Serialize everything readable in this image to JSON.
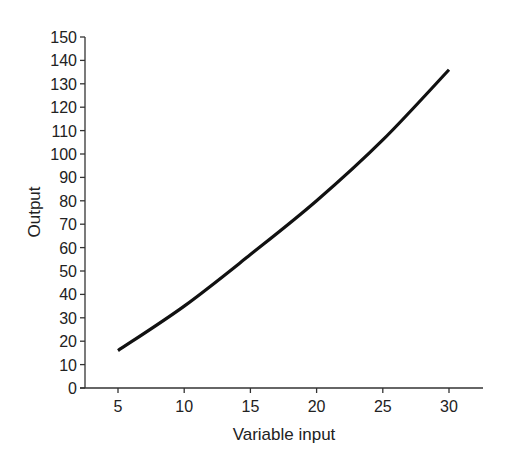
{
  "chart_data": {
    "type": "line",
    "title": "",
    "xlabel": "Variable input",
    "ylabel": "Output",
    "x": [
      5,
      10,
      15,
      20,
      25,
      30
    ],
    "series": [
      {
        "name": "Output",
        "values": [
          16,
          35,
          57,
          80,
          106,
          136
        ],
        "color": "#111111"
      }
    ],
    "xticks": [
      5,
      10,
      15,
      20,
      25,
      30
    ],
    "yticks": [
      0,
      10,
      20,
      30,
      40,
      50,
      60,
      70,
      80,
      90,
      100,
      110,
      120,
      130,
      140,
      150
    ],
    "xlim": [
      2.5,
      31.5
    ],
    "ylim": [
      0,
      150
    ],
    "grid": false,
    "legend": "none"
  }
}
